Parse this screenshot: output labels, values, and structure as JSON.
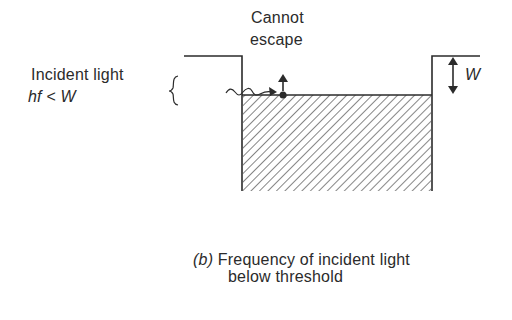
{
  "diagram": {
    "labels": {
      "cannot_line1": "Cannot",
      "cannot_line2": "escape",
      "incident_line1": "Incident light",
      "incident_hf": "hf",
      "incident_lt": "<",
      "incident_w": "W",
      "work_function": "W"
    },
    "caption": {
      "tag": "(b)",
      "line1": "Frequency of incident light",
      "line2": "below threshold"
    },
    "colors": {
      "ink": "#2b2b2b",
      "background": "#ffffff"
    }
  }
}
